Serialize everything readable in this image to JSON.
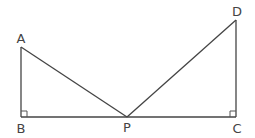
{
  "diagram": {
    "type": "geometry",
    "colors": {
      "line": "#444444",
      "label": "#444444",
      "background": "#ffffff"
    },
    "points": {
      "A": {
        "label": "A",
        "x": 21,
        "y": 47
      },
      "B": {
        "label": "B",
        "x": 21,
        "y": 117
      },
      "P": {
        "label": "P",
        "x": 127,
        "y": 117
      },
      "C": {
        "label": "C",
        "x": 236,
        "y": 117
      },
      "D": {
        "label": "D",
        "x": 236,
        "y": 20
      }
    },
    "segments": [
      {
        "from": "A",
        "to": "B"
      },
      {
        "from": "B",
        "to": "C"
      },
      {
        "from": "A",
        "to": "P"
      },
      {
        "from": "P",
        "to": "D"
      },
      {
        "from": "D",
        "to": "C"
      }
    ],
    "right_angles": [
      "B",
      "C"
    ],
    "labels": {
      "A": "A",
      "B": "B",
      "P": "P",
      "C": "C",
      "D": "D"
    }
  }
}
